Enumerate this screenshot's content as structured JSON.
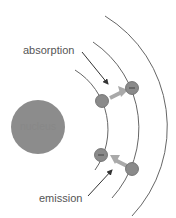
{
  "labels": {
    "absorption": "absorption",
    "emission": "emission",
    "nucleus": "nucleus"
  },
  "electron_symbol": "−",
  "colors": {
    "orbit": "#666666",
    "nucleus": "#8c8c8c",
    "electron": "#8a8a8a",
    "transition_arrow": "#a9a9a9",
    "photon_arrow": "#333333",
    "label": "#555555"
  },
  "orbits": [
    {
      "level": 1,
      "radius": 70
    },
    {
      "level": 2,
      "radius": 104
    },
    {
      "level": 3,
      "radius": 130
    }
  ]
}
